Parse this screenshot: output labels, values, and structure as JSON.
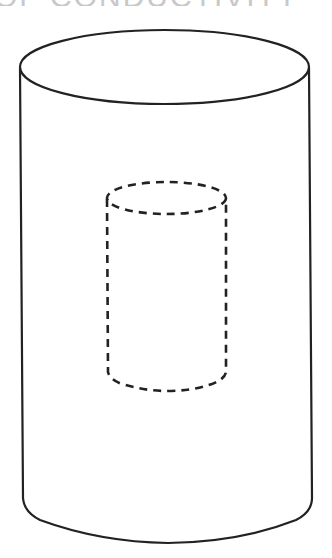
{
  "heading": {
    "text": "OF CONDUCTIVITY",
    "clipped": true
  },
  "figure": {
    "stroke_color": "#222222",
    "outer_cylinder": {
      "style": "solid",
      "top_ellipse": {
        "cx": 164.5,
        "cy": 67,
        "rx": 144.5,
        "ry": 37
      },
      "left_side": {
        "x_top": 20,
        "y_top": 67,
        "x_bottom": 24,
        "y_bottom": 505
      },
      "right_side": {
        "x_top": 309,
        "y_top": 67,
        "x_bottom": 312,
        "y_bottom": 505
      },
      "bottom_arc_lowest_y": 542
    },
    "inner_cylinder": {
      "style": "dashed",
      "top_ellipse": {
        "cx": 166.5,
        "cy": 198,
        "rx": 59.5,
        "ry": 16
      },
      "left_side": {
        "x": 107,
        "y_top": 198,
        "y_bottom": 374
      },
      "right_side": {
        "x": 226,
        "y_top": 198,
        "y_bottom": 374
      },
      "bottom_arc_lowest_y": 391
    }
  }
}
